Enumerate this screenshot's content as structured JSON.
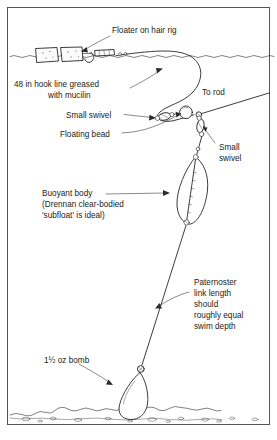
{
  "figure": {
    "background_color": "#ffffff",
    "ink_color": "#1a1a1a",
    "frame_color": "#555555"
  },
  "labels": {
    "floater_hair_rig": "Floater on hair rig",
    "hook_line_l1": "48 in hook line greased",
    "hook_line_l2": "with mucilin",
    "to_rod": "To rod",
    "small_swivel_left": "Small swivel",
    "floating_bead": "Floating bead",
    "small_swivel_right_l1": "Small",
    "small_swivel_right_l2": "swivel",
    "buoyant_body_l1": "Buoyant body",
    "buoyant_body_l2": "(Drennan clear-bodied",
    "buoyant_body_l3": "'subfloat' is ideal)",
    "paternoster_l1": "Paternoster",
    "paternoster_l2": "link length",
    "paternoster_l3": "should",
    "paternoster_l4": "roughly equal",
    "paternoster_l5": "swim depth",
    "bomb": "1½ oz bomb"
  },
  "components": [
    {
      "name": "floater-bait-1",
      "type": "square bait on hair rig"
    },
    {
      "name": "floater-bait-2",
      "type": "square bait on hair rig"
    },
    {
      "name": "hook",
      "type": "hook"
    },
    {
      "name": "line-sleeve",
      "type": "tube sleeve"
    },
    {
      "name": "small-swivel-upper",
      "type": "swivel"
    },
    {
      "name": "floating-bead",
      "type": "round bead"
    },
    {
      "name": "small-swivel-lower",
      "type": "swivel"
    },
    {
      "name": "buoyant-body",
      "type": "clear-bodied subfloat"
    },
    {
      "name": "bomb-weight",
      "type": "pear bomb lead"
    },
    {
      "name": "water-surface",
      "type": "waterline"
    },
    {
      "name": "lake-bed",
      "type": "bed with pebbles"
    }
  ]
}
